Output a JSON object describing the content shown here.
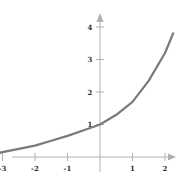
{
  "chart_data": {
    "type": "line",
    "title": "",
    "xlabel": "",
    "ylabel": "",
    "xlim": [
      -3.3,
      2.6
    ],
    "ylim": [
      -0.2,
      4.6
    ],
    "grid": false,
    "legend": null,
    "x_ticks": [
      "-3",
      "-2",
      "-1",
      "1",
      "2"
    ],
    "y_ticks": [
      "1",
      "2",
      "3",
      "4"
    ],
    "series": [
      {
        "name": "curve",
        "color": "#7a7a7a",
        "x": [
          -3.2,
          -3,
          -2.5,
          -2,
          -1.5,
          -1,
          -0.5,
          0,
          0.5,
          1,
          1.5,
          2,
          2.25
        ],
        "y": [
          0.1,
          0.15,
          0.25,
          0.35,
          0.5,
          0.65,
          0.82,
          1.0,
          1.3,
          1.7,
          2.35,
          3.2,
          3.8
        ]
      }
    ],
    "axis_color": "#b0b0b0"
  }
}
